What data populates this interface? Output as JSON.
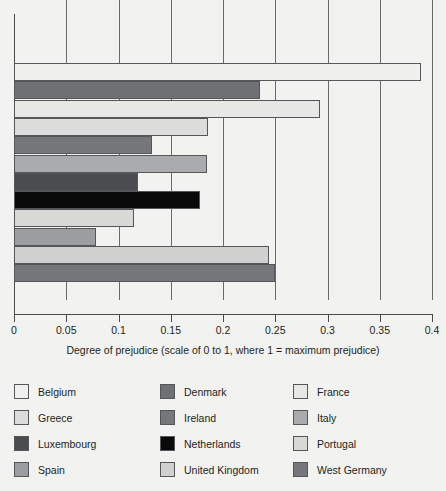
{
  "chart_data": {
    "type": "bar",
    "orientation": "horizontal",
    "title": "",
    "xlabel": "Degree of prejudice (scale of 0 to 1, where 1 = maximum prejudice)",
    "ylabel": "",
    "xlim": [
      0,
      0.4
    ],
    "xticks": [
      "0",
      "0.05",
      "0.1",
      "0.15",
      "0.2",
      "0.25",
      "0.3",
      "0.35",
      "0.4"
    ],
    "xtick_values": [
      0,
      0.05,
      0.1,
      0.15,
      0.2,
      0.25,
      0.3,
      0.35,
      0.4
    ],
    "grid": true,
    "grid_axis": "x",
    "legend_position": "bottom",
    "categories": [
      "Belgium",
      "Denmark",
      "France",
      "Greece",
      "Ireland",
      "Italy",
      "Luxembourg",
      "Netherlands",
      "Portugal",
      "Spain",
      "United Kingdom",
      "West Germany"
    ],
    "values": [
      0.389,
      0.235,
      0.293,
      0.186,
      0.132,
      0.185,
      0.119,
      0.178,
      0.115,
      0.078,
      0.244,
      0.25
    ],
    "colors": [
      "#f0f0ee",
      "#6e7073",
      "#e7e8e5",
      "#dcdddb",
      "#75777a",
      "#a9abad",
      "#4a4c4f",
      "#090909",
      "#d8d9d7",
      "#9b9d9f",
      "#d0d1cf",
      "#75777a"
    ]
  },
  "legend": {
    "columns": 3,
    "rows": 4,
    "items": [
      {
        "label": "Belgium",
        "color": "#f0f0ee"
      },
      {
        "label": "Greece",
        "color": "#dcdddb"
      },
      {
        "label": "Luxembourg",
        "color": "#4a4c4f"
      },
      {
        "label": "Spain",
        "color": "#9b9d9f"
      },
      {
        "label": "Denmark",
        "color": "#6e7073"
      },
      {
        "label": "Ireland",
        "color": "#75777a"
      },
      {
        "label": "Netherlands",
        "color": "#090909"
      },
      {
        "label": "United Kingdom",
        "color": "#d0d1cf"
      },
      {
        "label": "France",
        "color": "#e7e8e5"
      },
      {
        "label": "Italy",
        "color": "#a9abad"
      },
      {
        "label": "Portugal",
        "color": "#d8d9d7"
      },
      {
        "label": "West Germany",
        "color": "#75777a"
      }
    ]
  }
}
